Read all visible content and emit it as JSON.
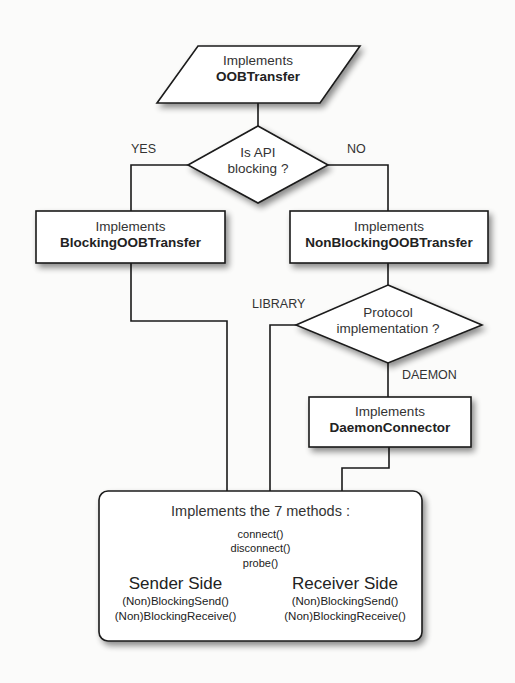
{
  "nodes": {
    "start": {
      "line1": "Implements",
      "line2": "OOBTransfer",
      "shape": "parallelogram"
    },
    "decision_api": {
      "line1": "Is API",
      "line2": "blocking ?",
      "shape": "diamond"
    },
    "blocking": {
      "line1": "Implements",
      "line2": "BlockingOOBTransfer",
      "shape": "rectangle"
    },
    "nonblocking": {
      "line1": "Implements",
      "line2": "NonBlockingOOBTransfer",
      "shape": "rectangle"
    },
    "decision_protocol": {
      "line1": "Protocol",
      "line2": "implementation ?",
      "shape": "diamond"
    },
    "daemon": {
      "line1": "Implements",
      "line2": "DaemonConnector",
      "shape": "rectangle"
    },
    "final": {
      "title": "Implements the 7 methods :",
      "common_methods": [
        "connect()",
        "disconnect()",
        "probe()"
      ],
      "sender": {
        "title": "Sender Side",
        "methods": [
          "(Non)BlockingSend()",
          "(Non)BlockingReceive()"
        ]
      },
      "receiver": {
        "title": "Receiver Side",
        "methods": [
          "(Non)BlockingSend()",
          "(Non)BlockingReceive()"
        ]
      },
      "shape": "rounded-rectangle"
    }
  },
  "edges": {
    "yes": "YES",
    "no": "NO",
    "library": "LIBRARY",
    "daemon": "DAEMON"
  },
  "colors": {
    "stroke": "#1a1a1a",
    "fill": "#ffffff",
    "background": "#fbfbfa"
  }
}
